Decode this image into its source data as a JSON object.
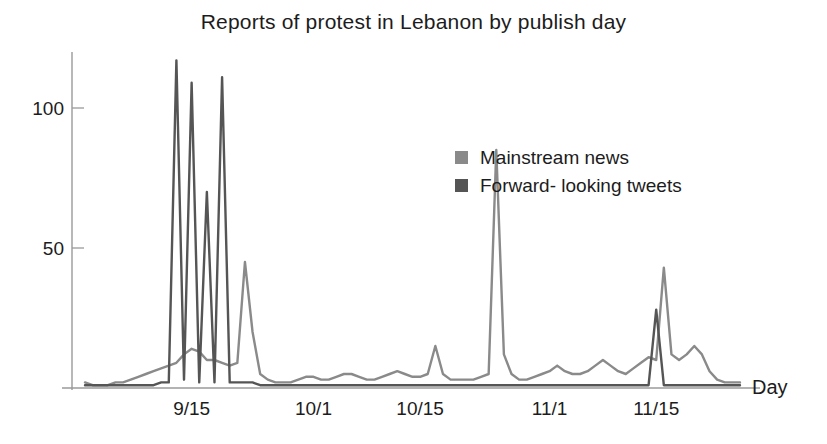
{
  "chart_data": {
    "type": "line",
    "title": "Reports of protest in Lebanon by publish day",
    "xlabel": "Day",
    "ylabel": "",
    "grid": false,
    "legend_position": "inside-right",
    "ylim": [
      0,
      120
    ],
    "yticks": [
      50,
      100
    ],
    "ytick_labels": [
      "50",
      "100"
    ],
    "xtick_labels": [
      "9/15",
      "10/1",
      "10/15",
      "11/1",
      "11/15"
    ],
    "xtick_values": [
      15,
      31,
      45,
      62,
      76
    ],
    "x_start_label": "9/5",
    "x_end_label": "11/30",
    "colors": {
      "mainstream_news": "#8a8a8a",
      "forward_looking_tweets": "#555555",
      "axis": "#9a9a9a",
      "text": "#1c1c1c"
    },
    "series": [
      {
        "name": "Mainstream news",
        "color": "#8a8a8a",
        "x": [
          1,
          2,
          3,
          4,
          5,
          6,
          7,
          8,
          9,
          10,
          11,
          12,
          13,
          14,
          15,
          16,
          17,
          18,
          19,
          20,
          21,
          22,
          23,
          24,
          25,
          26,
          27,
          28,
          29,
          30,
          31,
          32,
          33,
          34,
          35,
          36,
          37,
          38,
          39,
          40,
          41,
          42,
          43,
          44,
          45,
          46,
          47,
          48,
          49,
          50,
          51,
          52,
          53,
          54,
          55,
          56,
          57,
          58,
          59,
          60,
          61,
          62,
          63,
          64,
          65,
          66,
          67,
          68,
          69,
          70,
          71,
          72,
          73,
          74,
          75,
          76,
          77,
          78,
          79,
          80,
          81,
          82,
          83,
          84,
          85,
          86,
          87
        ],
        "values": [
          2,
          1,
          1,
          1,
          2,
          2,
          3,
          4,
          5,
          6,
          7,
          8,
          9,
          12,
          14,
          13,
          10,
          10,
          9,
          8,
          9,
          45,
          20,
          5,
          3,
          2,
          2,
          2,
          3,
          4,
          4,
          3,
          3,
          4,
          5,
          5,
          4,
          3,
          3,
          4,
          5,
          6,
          5,
          4,
          4,
          5,
          15,
          5,
          3,
          3,
          3,
          3,
          4,
          5,
          85,
          12,
          5,
          3,
          3,
          4,
          5,
          6,
          8,
          6,
          5,
          5,
          6,
          8,
          10,
          8,
          6,
          5,
          7,
          9,
          11,
          10,
          43,
          12,
          10,
          12,
          15,
          12,
          6,
          3,
          2,
          2,
          2
        ]
      },
      {
        "name": "Forward- looking tweets",
        "color": "#555555",
        "x": [
          1,
          2,
          3,
          4,
          5,
          6,
          7,
          8,
          9,
          10,
          11,
          12,
          13,
          14,
          15,
          16,
          17,
          18,
          19,
          20,
          21,
          22,
          23,
          24,
          25,
          26,
          27,
          28,
          29,
          30,
          31,
          32,
          33,
          34,
          35,
          36,
          37,
          38,
          39,
          40,
          41,
          42,
          43,
          44,
          45,
          46,
          47,
          48,
          49,
          50,
          51,
          52,
          53,
          54,
          55,
          56,
          57,
          58,
          59,
          60,
          61,
          62,
          63,
          64,
          65,
          66,
          67,
          68,
          69,
          70,
          71,
          72,
          73,
          74,
          75,
          76,
          77,
          78,
          79,
          80,
          81,
          82,
          83,
          84,
          85,
          86,
          87
        ],
        "values": [
          1,
          1,
          1,
          1,
          1,
          1,
          1,
          1,
          1,
          1,
          2,
          2,
          117,
          3,
          109,
          2,
          70,
          2,
          111,
          2,
          2,
          2,
          2,
          1,
          1,
          1,
          1,
          1,
          1,
          1,
          1,
          1,
          1,
          1,
          1,
          1,
          1,
          1,
          1,
          1,
          1,
          1,
          1,
          1,
          1,
          1,
          1,
          1,
          1,
          1,
          1,
          1,
          1,
          1,
          1,
          1,
          1,
          1,
          1,
          1,
          1,
          1,
          1,
          1,
          1,
          1,
          1,
          1,
          1,
          1,
          1,
          1,
          1,
          1,
          1,
          28,
          1,
          1,
          1,
          1,
          1,
          1,
          1,
          1,
          1,
          1,
          1
        ]
      }
    ],
    "annotations": [
      {
        "label": "peak-tweets-1",
        "value": 117
      },
      {
        "label": "peak-tweets-2",
        "value": 109
      },
      {
        "label": "peak-tweets-3",
        "value": 111
      },
      {
        "label": "peak-news-mid-oct",
        "value": 85
      },
      {
        "label": "peak-news-nov",
        "value": 43
      }
    ]
  },
  "legend": {
    "items": [
      {
        "label": "Mainstream news",
        "color": "#8a8a8a",
        "name": "legend-mainstream-news"
      },
      {
        "label": "Forward- looking tweets",
        "color": "#555555",
        "name": "legend-forward-looking-tweets"
      }
    ]
  }
}
